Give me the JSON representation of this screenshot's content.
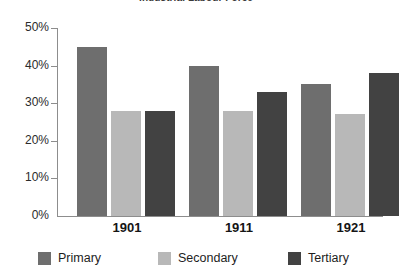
{
  "chart_data": {
    "type": "bar",
    "title": "Industrial Labour Force",
    "xlabel": "",
    "ylabel": "",
    "categories": [
      "1901",
      "1911",
      "1921"
    ],
    "series": [
      {
        "name": "Primary",
        "values": [
          45,
          40,
          35
        ],
        "color": "#6e6e6e"
      },
      {
        "name": "Secondary",
        "values": [
          28,
          28,
          27
        ],
        "color": "#b8b8b8"
      },
      {
        "name": "Tertiary",
        "values": [
          28,
          33,
          38
        ],
        "color": "#424242"
      }
    ],
    "ylim": [
      0,
      50
    ],
    "y_ticks": [
      "0%",
      "10%",
      "20%",
      "30%",
      "40%",
      "50%"
    ],
    "y_tick_values": [
      0,
      10,
      20,
      30,
      40,
      50
    ],
    "grid": false,
    "legend_position": "bottom"
  },
  "axis": {
    "y_labels": {
      "t50": "50%",
      "t40": "40%",
      "t30": "30%",
      "t20": "20%",
      "t10": "10%",
      "t0": "0%"
    },
    "x_labels": {
      "g0": "1901",
      "g1": "1911",
      "g2": "1921"
    }
  },
  "legend": {
    "items": [
      {
        "label": "Primary"
      },
      {
        "label": "Secondary"
      },
      {
        "label": "Tertiary"
      }
    ]
  }
}
